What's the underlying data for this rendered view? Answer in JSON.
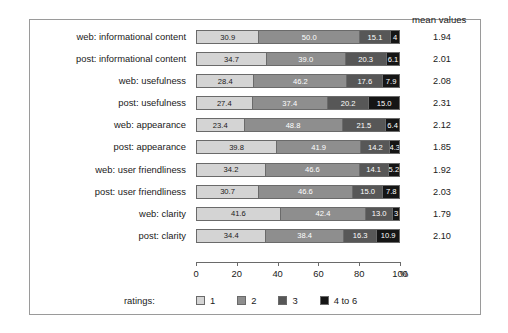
{
  "header": {
    "mean_label": "mean values"
  },
  "axis": {
    "ticks": [
      {
        "value": 0,
        "label": "0"
      },
      {
        "value": 20,
        "label": "20"
      },
      {
        "value": 40,
        "label": "40"
      },
      {
        "value": 60,
        "label": "60"
      },
      {
        "value": 80,
        "label": "80"
      },
      {
        "value": 100,
        "label": "100"
      }
    ],
    "unit": "%"
  },
  "legend": {
    "title": "ratings:",
    "items": [
      {
        "label": "1",
        "color": "#d4d4d4"
      },
      {
        "label": "2",
        "color": "#8e8e8e"
      },
      {
        "label": "3",
        "color": "#575757"
      },
      {
        "label": "4 to 6",
        "color": "#151515"
      }
    ]
  },
  "chart_data": {
    "type": "bar",
    "orientation": "horizontal",
    "stacked": true,
    "title": "",
    "xlabel": "%",
    "ylabel": "",
    "xlim": [
      0,
      100
    ],
    "grid": false,
    "legend_position": "bottom",
    "categories": [
      "web: informational content",
      "post: informational content",
      "web: usefulness",
      "post: usefulness",
      "web: appearance",
      "post: appearance",
      "web: user friendliness",
      "post: user friendliness",
      "web: clarity",
      "post: clarity"
    ],
    "series": [
      {
        "name": "1",
        "values": [
          30.9,
          34.7,
          28.4,
          27.4,
          23.4,
          39.8,
          34.2,
          30.7,
          41.6,
          34.4
        ]
      },
      {
        "name": "2",
        "values": [
          50.0,
          39.0,
          46.2,
          37.4,
          48.8,
          41.9,
          46.6,
          46.6,
          42.4,
          38.4
        ]
      },
      {
        "name": "3",
        "values": [
          15.1,
          20.3,
          17.6,
          20.2,
          21.5,
          14.2,
          14.1,
          15.0,
          13.0,
          16.3
        ]
      },
      {
        "name": "4 to 6",
        "values": [
          4.0,
          6.1,
          7.9,
          15.0,
          6.4,
          4.3,
          5.2,
          7.8,
          3.0,
          10.9
        ]
      }
    ],
    "data_labels": [
      [
        "30.9",
        "50.0",
        "15.1",
        "4"
      ],
      [
        "34.7",
        "39.0",
        "20.3",
        "6.1"
      ],
      [
        "28.4",
        "46.2",
        "17.6",
        "7.9"
      ],
      [
        "27.4",
        "37.4",
        "20.2",
        "15.0"
      ],
      [
        "23.4",
        "48.8",
        "21.5",
        "6.4"
      ],
      [
        "39.8",
        "41.9",
        "14.2",
        "4.3"
      ],
      [
        "34.2",
        "46.6",
        "14.1",
        "5.2"
      ],
      [
        "30.7",
        "46.6",
        "15.0",
        "7.8"
      ],
      [
        "41.6",
        "42.4",
        "13.0",
        "3"
      ],
      [
        "34.4",
        "38.4",
        "16.3",
        "10.9"
      ]
    ],
    "mean_values": [
      "1.94",
      "2.01",
      "2.08",
      "2.31",
      "2.12",
      "1.85",
      "1.92",
      "2.03",
      "1.79",
      "2.10"
    ]
  }
}
